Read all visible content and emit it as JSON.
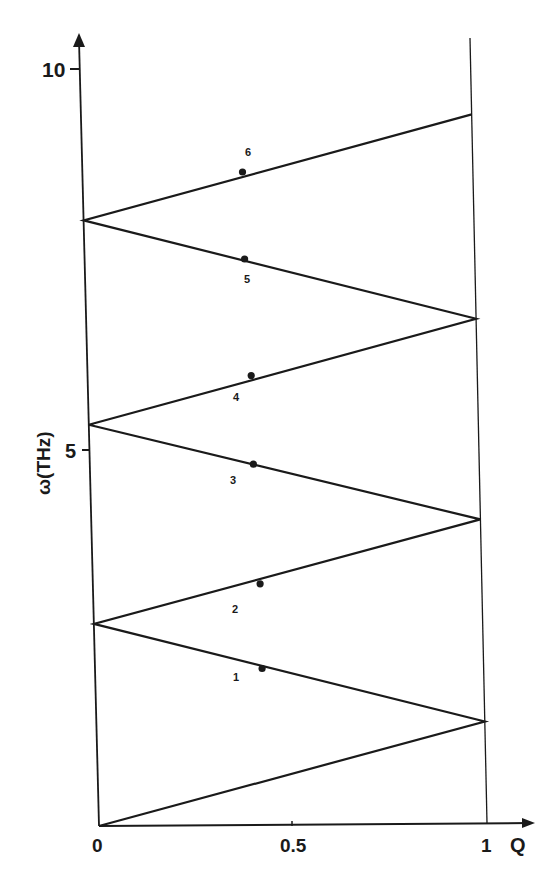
{
  "chart_data": {
    "type": "line",
    "title": "",
    "xlabel": "Q",
    "ylabel": "ω(THz)",
    "xlim": [
      0,
      1
    ],
    "ylim": [
      0,
      10
    ],
    "x_ticks": [
      {
        "value": 0,
        "label": "0"
      },
      {
        "value": 0.5,
        "label": "0.5"
      },
      {
        "value": 1,
        "label": "1"
      }
    ],
    "y_ticks": [
      {
        "value": 5,
        "label": "5"
      },
      {
        "value": 10,
        "label": "10"
      }
    ],
    "grid": false,
    "legend": null,
    "series": [
      {
        "name": "folded-dispersion",
        "x": [
          0,
          1,
          0,
          1,
          0,
          1,
          0,
          1
        ],
        "y": [
          0,
          1.38,
          2.67,
          4.05,
          5.3,
          6.7,
          8.0,
          9.4
        ]
      }
    ],
    "points": [
      {
        "label": "1",
        "x": 0.43,
        "y": 2.08
      },
      {
        "label": "2",
        "x": 0.43,
        "y": 3.2
      },
      {
        "label": "3",
        "x": 0.42,
        "y": 4.78
      },
      {
        "label": "4",
        "x": 0.42,
        "y": 5.95
      },
      {
        "label": "5",
        "x": 0.41,
        "y": 7.49
      },
      {
        "label": "6",
        "x": 0.41,
        "y": 8.64
      }
    ],
    "annotations": [
      "1",
      "2",
      "3",
      "4",
      "5",
      "6"
    ],
    "colors": {
      "ink": "#1a1a1a",
      "background": "#ffffff"
    }
  },
  "axes": {
    "x_label": "Q",
    "y_label": "ω(THz)",
    "x_tick_labels": [
      "0",
      "0.5",
      "1"
    ],
    "y_tick_labels": [
      "5",
      "10"
    ]
  },
  "branch_labels": [
    "1",
    "2",
    "3",
    "4",
    "5",
    "6"
  ]
}
